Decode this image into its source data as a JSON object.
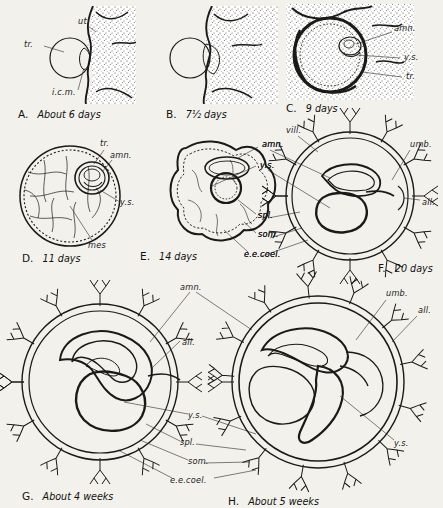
{
  "figure": {
    "background_color": "#f3f1ec",
    "ink_color": "#1a1a18"
  },
  "abbreviations": {
    "ut": "ut.",
    "tr": "tr.",
    "icm": "i.c.m.",
    "amn": "amn.",
    "ys": "y.s.",
    "mes": "mes",
    "spl": "spl.",
    "som": "som.",
    "eecoel": "e.e.coel.",
    "vill": "vill.",
    "umb": "umb.",
    "all": "all."
  },
  "panels": [
    {
      "id": "A",
      "letter": "A.",
      "caption": "About 6 days",
      "labels": [
        {
          "text": "ut.",
          "x": 78,
          "y": 24
        },
        {
          "text": "tr.",
          "x": 28,
          "y": 47
        },
        {
          "text": "i.c.m.",
          "x": 56,
          "y": 93
        }
      ]
    },
    {
      "id": "B",
      "letter": "B.",
      "caption": "7½ days",
      "labels": []
    },
    {
      "id": "C",
      "letter": "C.",
      "caption": "9 days",
      "labels": [
        {
          "text": "amn.",
          "x": 394,
          "y": 31
        },
        {
          "text": "y.s.",
          "x": 404,
          "y": 60
        },
        {
          "text": "tr.",
          "x": 406,
          "y": 79
        }
      ]
    },
    {
      "id": "D",
      "letter": "D.",
      "caption": "11 days",
      "labels": [
        {
          "text": "tr.",
          "x": 104,
          "y": 145
        },
        {
          "text": "amn.",
          "x": 114,
          "y": 157
        },
        {
          "text": "y.s.",
          "x": 122,
          "y": 203
        },
        {
          "text": "mes",
          "x": 92,
          "y": 245
        }
      ]
    },
    {
      "id": "E",
      "letter": "E.",
      "caption": "14 days",
      "labels": [
        {
          "text": "amn.",
          "x": 262,
          "y": 145
        },
        {
          "text": "y.s.",
          "x": 260,
          "y": 165
        },
        {
          "text": "spl.",
          "x": 258,
          "y": 216
        },
        {
          "text": "som.",
          "x": 258,
          "y": 236
        },
        {
          "text": "e.e.coel.",
          "x": 246,
          "y": 256
        }
      ]
    },
    {
      "id": "F",
      "letter": "F.",
      "caption": "20 days",
      "labels": [
        {
          "text": "vill.",
          "x": 288,
          "y": 131
        },
        {
          "text": "umb.",
          "x": 412,
          "y": 146
        },
        {
          "text": "all.",
          "x": 423,
          "y": 203
        }
      ]
    },
    {
      "id": "G",
      "letter": "G.",
      "caption": "About 4 weeks",
      "labels": [
        {
          "text": "all.",
          "x": 182,
          "y": 343
        }
      ]
    },
    {
      "id": "H",
      "letter": "H.",
      "caption": "About 5 weeks",
      "labels": [
        {
          "text": "umb.",
          "x": 388,
          "y": 295
        },
        {
          "text": "all.",
          "x": 419,
          "y": 311
        },
        {
          "text": "y.s.",
          "x": 396,
          "y": 444
        }
      ]
    }
  ],
  "shared_labels": [
    {
      "text": "amn.",
      "x": 182,
      "y": 289
    },
    {
      "text": "y.s.",
      "x": 190,
      "y": 416
    },
    {
      "text": "spl.",
      "x": 182,
      "y": 443
    },
    {
      "text": "som.",
      "x": 190,
      "y": 462
    },
    {
      "text": "e.e.coel.",
      "x": 172,
      "y": 481
    }
  ],
  "captions": [
    {
      "id": "A",
      "letter": "A.",
      "text": "About 6 days",
      "x": 18,
      "y": 114
    },
    {
      "id": "B",
      "letter": "B.",
      "text": "7½ days",
      "x": 166,
      "y": 114
    },
    {
      "id": "C",
      "letter": "C.",
      "text": "9 days",
      "x": 286,
      "y": 109
    },
    {
      "id": "D",
      "letter": "D.",
      "text": "11 days",
      "x": 26,
      "y": 258
    },
    {
      "id": "E",
      "letter": "E.",
      "text": "14 days",
      "x": 140,
      "y": 256
    },
    {
      "id": "F",
      "letter": "F.",
      "text": "20 days",
      "x": 378,
      "y": 268
    },
    {
      "id": "G",
      "letter": "G.",
      "text": "About 4 weeks",
      "x": 22,
      "y": 497
    },
    {
      "id": "H",
      "letter": "H.",
      "text": "About 5 weeks",
      "x": 228,
      "y": 503
    }
  ]
}
